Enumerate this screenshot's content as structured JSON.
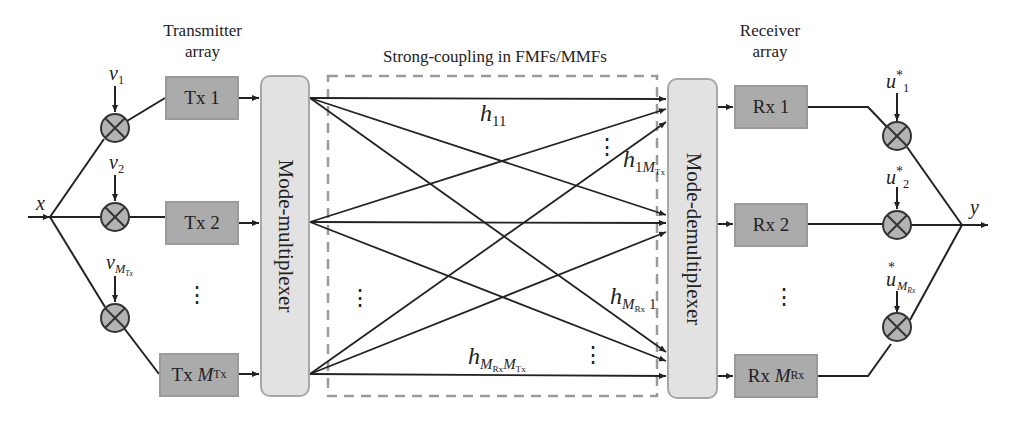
{
  "titles": {
    "transmitter": [
      "Transmitter",
      "array"
    ],
    "coupling": "Strong-coupling in FMFs/MMFs",
    "receiver": [
      "Receiver",
      "array"
    ]
  },
  "input_label": "x",
  "output_label": "y",
  "tx_weights": [
    {
      "base": "v",
      "sub": "1"
    },
    {
      "base": "v",
      "sub": "2"
    },
    {
      "base": "v",
      "sub": "M",
      "subsub": "Tx"
    }
  ],
  "rx_weights": [
    {
      "base": "u",
      "sup": "*",
      "sub": "1"
    },
    {
      "base": "u",
      "sup": "*",
      "sub": "2"
    },
    {
      "base": "u",
      "sup": "*",
      "sub": "M",
      "subsub": "Rx"
    }
  ],
  "tx_boxes": [
    {
      "prefix": "Tx ",
      "main": "1",
      "sub": ""
    },
    {
      "prefix": "Tx ",
      "main": "2",
      "sub": ""
    },
    {
      "prefix": "Tx ",
      "main": "M",
      "sub": "Tx"
    }
  ],
  "rx_boxes": [
    {
      "prefix": "Rx ",
      "main": "1",
      "sub": ""
    },
    {
      "prefix": "Rx ",
      "main": "2",
      "sub": ""
    },
    {
      "prefix": "Rx ",
      "main": "M",
      "sub": "Rx"
    }
  ],
  "mux_label": "Mode-multiplexer",
  "demux_label": "Mode-demultiplexer",
  "channel_labels": {
    "h11": {
      "base": "h",
      "sub": "11"
    },
    "h1M": {
      "base": "h",
      "sub": "1",
      "subM": "M",
      "subsub": "Tx"
    },
    "hM1": {
      "base": "h",
      "subM": "M",
      "subsub": "Rx",
      "tail": " 1"
    },
    "hMM": {
      "base": "h",
      "subM1": "M",
      "subsub1": "Rx",
      "subM2": "M",
      "subsub2": "Tx"
    }
  },
  "ellipsis": "⋮",
  "colors": {
    "box_fill": "#ababab",
    "box_border": "#9a9a9a",
    "mux_fill": "#e2e2e2",
    "mux_border": "#a8a8a8",
    "multiplier_fill": "#b3b3b3",
    "line": "#222222",
    "dashed": "#9a9a9a"
  }
}
